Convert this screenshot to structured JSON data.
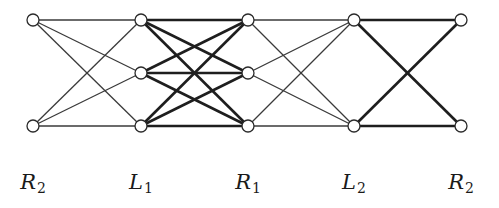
{
  "diagram": {
    "type": "layered-bipartite-graph",
    "columns": [
      {
        "id": "c0",
        "label_main": "R",
        "label_sub": "2",
        "x": 33
      },
      {
        "id": "c1",
        "label_main": "L",
        "label_sub": "1",
        "x": 141
      },
      {
        "id": "c2",
        "label_main": "R",
        "label_sub": "1",
        "x": 248
      },
      {
        "id": "c3",
        "label_main": "L",
        "label_sub": "2",
        "x": 354
      },
      {
        "id": "c4",
        "label_main": "R",
        "label_sub": "2",
        "x": 461
      }
    ],
    "rows_y": {
      "top": 20,
      "mid": 73,
      "bot": 126
    },
    "nodes": [
      {
        "id": "c0-top",
        "col": 0,
        "row": "top"
      },
      {
        "id": "c0-bot",
        "col": 0,
        "row": "bot"
      },
      {
        "id": "c1-top",
        "col": 1,
        "row": "top"
      },
      {
        "id": "c1-mid",
        "col": 1,
        "row": "mid"
      },
      {
        "id": "c1-bot",
        "col": 1,
        "row": "bot"
      },
      {
        "id": "c2-top",
        "col": 2,
        "row": "top"
      },
      {
        "id": "c2-mid",
        "col": 2,
        "row": "mid"
      },
      {
        "id": "c2-bot",
        "col": 2,
        "row": "bot"
      },
      {
        "id": "c3-top",
        "col": 3,
        "row": "top"
      },
      {
        "id": "c3-bot",
        "col": 3,
        "row": "bot"
      },
      {
        "id": "c4-top",
        "col": 4,
        "row": "top"
      },
      {
        "id": "c4-bot",
        "col": 4,
        "row": "bot"
      }
    ],
    "edges": [
      {
        "from": "c0-top",
        "to": "c1-top",
        "weight": "thin"
      },
      {
        "from": "c0-top",
        "to": "c1-mid",
        "weight": "thin"
      },
      {
        "from": "c0-top",
        "to": "c1-bot",
        "weight": "thin"
      },
      {
        "from": "c0-bot",
        "to": "c1-top",
        "weight": "thin"
      },
      {
        "from": "c0-bot",
        "to": "c1-mid",
        "weight": "thin"
      },
      {
        "from": "c0-bot",
        "to": "c1-bot",
        "weight": "thin"
      },
      {
        "from": "c1-top",
        "to": "c2-top",
        "weight": "thick"
      },
      {
        "from": "c1-top",
        "to": "c2-mid",
        "weight": "thick"
      },
      {
        "from": "c1-top",
        "to": "c2-bot",
        "weight": "thick"
      },
      {
        "from": "c1-mid",
        "to": "c2-top",
        "weight": "thick"
      },
      {
        "from": "c1-mid",
        "to": "c2-mid",
        "weight": "thick"
      },
      {
        "from": "c1-mid",
        "to": "c2-bot",
        "weight": "thick"
      },
      {
        "from": "c1-bot",
        "to": "c2-top",
        "weight": "thick"
      },
      {
        "from": "c1-bot",
        "to": "c2-mid",
        "weight": "thick"
      },
      {
        "from": "c1-bot",
        "to": "c2-bot",
        "weight": "thick"
      },
      {
        "from": "c2-top",
        "to": "c3-top",
        "weight": "thin"
      },
      {
        "from": "c2-top",
        "to": "c3-bot",
        "weight": "thin"
      },
      {
        "from": "c2-mid",
        "to": "c3-top",
        "weight": "thin"
      },
      {
        "from": "c2-mid",
        "to": "c3-bot",
        "weight": "thin"
      },
      {
        "from": "c2-bot",
        "to": "c3-top",
        "weight": "thin"
      },
      {
        "from": "c2-bot",
        "to": "c3-bot",
        "weight": "thin"
      },
      {
        "from": "c3-top",
        "to": "c4-top",
        "weight": "thick"
      },
      {
        "from": "c3-top",
        "to": "c4-bot",
        "weight": "thick"
      },
      {
        "from": "c3-bot",
        "to": "c4-top",
        "weight": "thick"
      },
      {
        "from": "c3-bot",
        "to": "c4-bot",
        "weight": "thick"
      }
    ],
    "node_radius": 6,
    "colors": {
      "line": "#1e1e1e",
      "node_fill": "#ffffff",
      "background": "#ffffff"
    }
  }
}
